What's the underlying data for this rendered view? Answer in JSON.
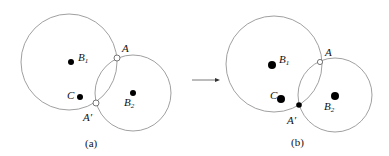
{
  "panels": [
    {
      "caption": "(a)",
      "labels": {
        "B1": "B",
        "B1_sub": "1",
        "A": "A",
        "C": "C",
        "A_prime": "A′",
        "B2": "B",
        "B2_sub": "2"
      },
      "points": {
        "A": "open",
        "A_prime": "open"
      }
    },
    {
      "caption": "(b)",
      "labels": {
        "B1": "B",
        "B1_sub": "1",
        "A": "A",
        "C": "C",
        "A_prime": "A′",
        "B2": "B",
        "B2_sub": "2"
      },
      "points": {
        "A": "open",
        "A_prime": "filled"
      }
    }
  ],
  "colors": {
    "stroke": "#888888",
    "dot": "#000000"
  }
}
